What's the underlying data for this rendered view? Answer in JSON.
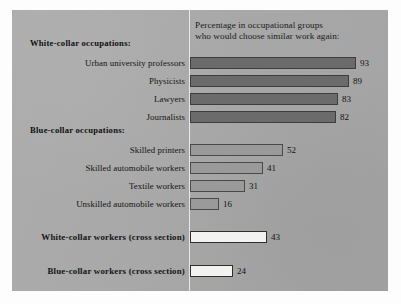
{
  "chart_data": {
    "type": "bar",
    "orientation": "horizontal",
    "title": "Percentage in occupational groups who would choose similar work again:",
    "title_lines": [
      "Percentage in occupational groups",
      "who would choose similar work again:"
    ],
    "xlabel": "",
    "ylabel": "",
    "xlim": [
      0,
      100
    ],
    "grid": false,
    "legend": "none",
    "categories": [
      "Urban university professors",
      "Physicists",
      "Lawyers",
      "Journalists",
      "Skilled printers",
      "Skilled automobile workers",
      "Textile workers",
      "Unskilled automobile workers",
      "White-collar workers (cross section)",
      "Blue-collar workers (cross section)"
    ],
    "values": [
      93,
      89,
      83,
      82,
      52,
      41,
      31,
      16,
      43,
      24
    ],
    "groups": [
      {
        "header": "White-collar occupations:",
        "style": "dark",
        "items": [
          {
            "label": "Urban university professors",
            "value": 93
          },
          {
            "label": "Physicists",
            "value": 89
          },
          {
            "label": "Lawyers",
            "value": 83
          },
          {
            "label": "Journalists",
            "value": 82
          }
        ]
      },
      {
        "header": "Blue-collar occupations:",
        "style": "light",
        "items": [
          {
            "label": "Skilled printers",
            "value": 52
          },
          {
            "label": "Skilled automobile workers",
            "value": 41
          },
          {
            "label": "Textile workers",
            "value": 31
          },
          {
            "label": "Unskilled automobile workers",
            "value": 16
          }
        ]
      },
      {
        "header": "",
        "style": "open",
        "items": [
          {
            "label": "White-collar workers (cross section)",
            "value": 43
          },
          {
            "label": "Blue-collar workers (cross section)",
            "value": 24
          }
        ]
      }
    ],
    "colors": {
      "panel_background": "#a9a9a9",
      "bar_dark": "#6b6b6b",
      "bar_light": "#9a9a9a",
      "bar_open": "#f2f2f0",
      "bar_outline": "#3d3d3d",
      "axis": "#e8e8e8",
      "text": "#141414"
    }
  },
  "rows": [
    {
      "label": "Urban university professors",
      "value": "93",
      "style": "dark",
      "bold": false,
      "top": 47,
      "px": 166
    },
    {
      "label": "Physicists",
      "value": "89",
      "style": "dark",
      "bold": false,
      "top": 65,
      "px": 159
    },
    {
      "label": "Lawyers",
      "value": "83",
      "style": "dark",
      "bold": false,
      "top": 83,
      "px": 148
    },
    {
      "label": "Journalists",
      "value": "82",
      "style": "dark",
      "bold": false,
      "top": 101,
      "px": 146
    },
    {
      "label": "Skilled printers",
      "value": "52",
      "style": "light",
      "bold": false,
      "top": 134,
      "px": 93
    },
    {
      "label": "Skilled automobile workers",
      "value": "41",
      "style": "light",
      "bold": false,
      "top": 152,
      "px": 73
    },
    {
      "label": "Textile workers",
      "value": "31",
      "style": "light",
      "bold": false,
      "top": 170,
      "px": 55
    },
    {
      "label": "Unskilled automobile workers",
      "value": "16",
      "style": "light",
      "bold": false,
      "top": 188,
      "px": 29
    },
    {
      "label": "White-collar workers (cross section)",
      "value": "43",
      "style": "open",
      "bold": true,
      "top": 221,
      "px": 77
    },
    {
      "label": "Blue-collar workers (cross section)",
      "value": "24",
      "style": "open",
      "bold": true,
      "top": 255,
      "px": 43
    }
  ],
  "section_headers": [
    {
      "text": "White-collar occupations:",
      "top": 28
    },
    {
      "text": "Blue-collar occupations:",
      "top": 115
    }
  ]
}
